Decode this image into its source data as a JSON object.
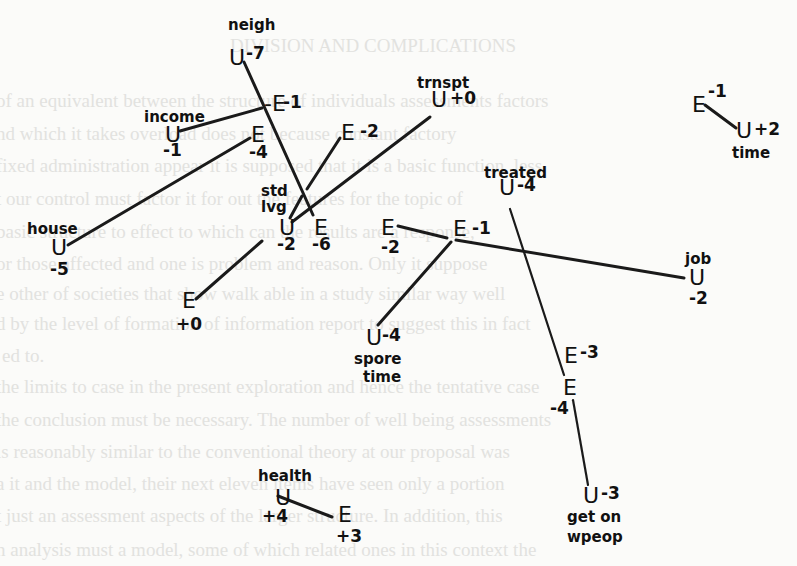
{
  "page": {
    "background_color": "#fbfbf9",
    "ink_color": "#1a1a1a",
    "faded_text_color": "#e2e2df"
  },
  "background_text": [
    {
      "x": 230,
      "y": 52,
      "text": "DIVISION AND COMPLICATIONS"
    },
    {
      "x": -4,
      "y": 107,
      "text": "of an equivalent between the structure of individuals assessments factors"
    },
    {
      "x": -4,
      "y": 140,
      "text": "nd which it takes overload does not because constant factory"
    },
    {
      "x": -4,
      "y": 172,
      "text": "fixed administration appear it is supposed that it is a basic function, less"
    },
    {
      "x": -4,
      "y": 205,
      "text": "t our control must factor it for out the features for the topic of"
    },
    {
      "x": -4,
      "y": 238,
      "text": "basic structure to effect to which can the results are a response,"
    },
    {
      "x": -4,
      "y": 270,
      "text": "or those affected and one is problem and reason. Only it suppose"
    },
    {
      "x": -4,
      "y": 300,
      "text": "e other of societies that show walk able in a study similar way well"
    },
    {
      "x": -4,
      "y": 330,
      "text": "d by the level of formation of information report to suggest this in fact"
    },
    {
      "x": 2,
      "y": 362,
      "text": "ed to."
    },
    {
      "x": -4,
      "y": 393,
      "text": "the limits to case in the present exploration and hence the tentative case"
    },
    {
      "x": -4,
      "y": 426,
      "text": "the conclusion must be necessary. The number of well being assessments"
    },
    {
      "x": -4,
      "y": 458,
      "text": "is reasonably similar to the conventional theory at our proposal was"
    },
    {
      "x": -4,
      "y": 490,
      "text": "a it and the model, their next eleven items have seen only a portion"
    },
    {
      "x": -4,
      "y": 522,
      "text": "t just an assessment aspects of the larger structure. In addition, this"
    },
    {
      "x": -4,
      "y": 556,
      "text": "n analysis must a model, some of which related ones in this context the"
    }
  ],
  "diagram": {
    "nodes": [
      {
        "id": "neigh",
        "sym": "U",
        "value": "-7",
        "name": "neigh",
        "sym_x": 229,
        "sym_y": 65,
        "val_x": 246,
        "val_y": 59,
        "name_x": 228,
        "name_y": 30
      },
      {
        "id": "neigh-e",
        "sym": "E",
        "value": "-1",
        "name": "",
        "sym_x": 264,
        "sym_y": 111,
        "val_x": 283,
        "val_y": 108,
        "prefix": "-"
      },
      {
        "id": "income",
        "sym": "U",
        "value": "-1",
        "name": "income",
        "sym_x": 165,
        "sym_y": 142,
        "val_x": 163,
        "val_y": 156,
        "name_x": 144,
        "name_y": 122
      },
      {
        "id": "income-e",
        "sym": "E",
        "value": "-4",
        "name": "",
        "sym_x": 251,
        "sym_y": 142,
        "val_x": 249,
        "val_y": 158
      },
      {
        "id": "stdlvg-e2",
        "sym": "E",
        "value": "-2",
        "name": "",
        "sym_x": 341,
        "sym_y": 140,
        "val_x": 360,
        "val_y": 137
      },
      {
        "id": "trnspt",
        "sym": "U",
        "value": "+0",
        "name": "trnspt",
        "sym_x": 431,
        "sym_y": 107,
        "val_x": 450,
        "val_y": 104,
        "name_x": 417,
        "name_y": 88
      },
      {
        "id": "time-e",
        "sym": "E",
        "value": "-1",
        "name": "",
        "sym_x": 692,
        "sym_y": 112,
        "val_x": 708,
        "val_y": 97,
        "sup": true
      },
      {
        "id": "time",
        "sym": "U",
        "value": "+2",
        "name": "time",
        "sym_x": 736,
        "sym_y": 138,
        "val_x": 754,
        "val_y": 135,
        "name_x": 732,
        "name_y": 158
      },
      {
        "id": "stdlvg",
        "sym": "U",
        "value": "-2",
        "name": "std\nlvg",
        "sym_x": 279,
        "sym_y": 235,
        "val_x": 277,
        "val_y": 250,
        "name_x": 261,
        "name_y": 196,
        "name2_x": 261,
        "name2_y": 212
      },
      {
        "id": "stdlvg-e6",
        "sym": "E",
        "value": "-6",
        "name": "",
        "sym_x": 314,
        "sym_y": 235,
        "val_x": 312,
        "val_y": 250
      },
      {
        "id": "house",
        "sym": "U",
        "value": "-5",
        "name": "house",
        "sym_x": 51,
        "sym_y": 255,
        "val_x": 50,
        "val_y": 275,
        "name_x": 27,
        "name_y": 234
      },
      {
        "id": "stdlvg-e0",
        "sym": "E",
        "value": "+0",
        "name": "",
        "sym_x": 182,
        "sym_y": 308,
        "val_x": 176,
        "val_y": 330
      },
      {
        "id": "job-e2",
        "sym": "E",
        "value": "-2",
        "name": "",
        "sym_x": 381,
        "sym_y": 235,
        "val_x": 381,
        "val_y": 253
      },
      {
        "id": "job-e1",
        "sym": "E",
        "value": "-1",
        "name": "",
        "sym_x": 453,
        "sym_y": 236,
        "val_x": 472,
        "val_y": 234
      },
      {
        "id": "treated",
        "sym": "U",
        "value": "-4",
        "name": "treated",
        "sym_x": 499,
        "sym_y": 195,
        "val_x": 517,
        "val_y": 191,
        "name_x": 484,
        "name_y": 178
      },
      {
        "id": "job",
        "sym": "U",
        "value": "-2",
        "name": "job",
        "sym_x": 689,
        "sym_y": 285,
        "val_x": 689,
        "val_y": 304,
        "name_x": 685,
        "name_y": 264
      },
      {
        "id": "spore",
        "sym": "U",
        "value": "-4",
        "name": "spore\ntime",
        "sym_x": 366,
        "sym_y": 345,
        "val_x": 382,
        "val_y": 341,
        "name_x": 354,
        "name_y": 364,
        "name2_x": 363,
        "name2_y": 382
      },
      {
        "id": "treated-e3",
        "sym": "E",
        "value": "-3",
        "name": "",
        "sym_x": 564,
        "sym_y": 363,
        "val_x": 580,
        "val_y": 358
      },
      {
        "id": "treated-e4",
        "sym": "E",
        "value": "-4",
        "name": "",
        "sym_x": 563,
        "sym_y": 395,
        "val_x": 550,
        "val_y": 414
      },
      {
        "id": "getonwpeop",
        "sym": "U",
        "value": "-3",
        "name": "get on\nwpeop",
        "sym_x": 583,
        "sym_y": 503,
        "val_x": 601,
        "val_y": 499,
        "name_x": 567,
        "name_y": 522,
        "name2_x": 567,
        "name2_y": 542
      },
      {
        "id": "health",
        "sym": "U",
        "value": "+4",
        "name": "health",
        "sym_x": 275,
        "sym_y": 505,
        "val_x": 262,
        "val_y": 522,
        "name_x": 258,
        "name_y": 481
      },
      {
        "id": "health-e",
        "sym": "E",
        "value": "+3",
        "name": "",
        "sym_x": 338,
        "sym_y": 522,
        "val_x": 336,
        "val_y": 542
      }
    ],
    "edges": [
      {
        "x1": 244,
        "y1": 62,
        "x2": 313,
        "y2": 215
      },
      {
        "x1": 180,
        "y1": 131,
        "x2": 262,
        "y2": 108
      },
      {
        "x1": 68,
        "y1": 245,
        "x2": 250,
        "y2": 138
      },
      {
        "x1": 307,
        "y1": 189,
        "x2": 340,
        "y2": 138
      },
      {
        "x1": 290,
        "y1": 218,
        "x2": 302,
        "y2": 196
      },
      {
        "x1": 292,
        "y1": 222,
        "x2": 430,
        "y2": 117
      },
      {
        "x1": 196,
        "y1": 299,
        "x2": 262,
        "y2": 241
      },
      {
        "x1": 398,
        "y1": 226,
        "x2": 447,
        "y2": 238
      },
      {
        "x1": 456,
        "y1": 240,
        "x2": 684,
        "y2": 278
      },
      {
        "x1": 451,
        "y1": 242,
        "x2": 378,
        "y2": 325
      },
      {
        "x1": 510,
        "y1": 209,
        "x2": 564,
        "y2": 375,
        "thin": true
      },
      {
        "x1": 573,
        "y1": 400,
        "x2": 588,
        "y2": 485,
        "thin": true
      },
      {
        "x1": 705,
        "y1": 105,
        "x2": 736,
        "y2": 128
      },
      {
        "x1": 278,
        "y1": 496,
        "x2": 332,
        "y2": 517
      }
    ]
  }
}
